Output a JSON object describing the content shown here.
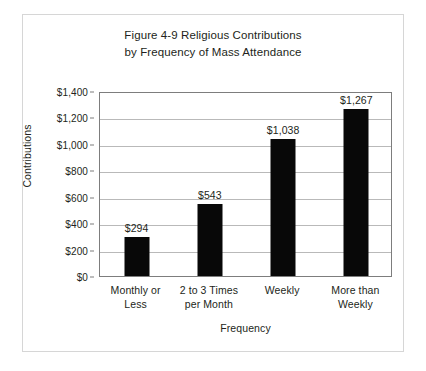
{
  "chart_data": {
    "type": "bar",
    "title": "Figure 4-9 Religious Contributions by Frequency of Mass Attendance",
    "title_lines": [
      "Figure 4-9 Religious Contributions",
      "by Frequency of Mass Attendance"
    ],
    "xlabel": "Frequency",
    "ylabel": "Contributions",
    "categories": [
      "Monthly or Less",
      "2 to 3 Times per Month",
      "Weekly",
      "More than Weekly"
    ],
    "category_lines": [
      [
        "Monthly or",
        "Less"
      ],
      [
        "2 to 3 Times",
        "per Month"
      ],
      [
        "Weekly",
        ""
      ],
      [
        "More than",
        "Weekly"
      ]
    ],
    "values": [
      294,
      543,
      1038,
      1267
    ],
    "value_labels": [
      "$294",
      "$543",
      "$1,038",
      "$1,267"
    ],
    "ylim": [
      0,
      1400
    ],
    "ytick_values": [
      0,
      200,
      400,
      600,
      800,
      1000,
      1200,
      1400
    ],
    "ytick_labels": [
      "$0",
      "$200",
      "$400",
      "$600",
      "$800",
      "$1,000",
      "$1,200",
      "$1,400"
    ],
    "grid": true,
    "legend": null,
    "bar_color": "#080808",
    "gridline_color": "#b9b9b9",
    "axis_color": "#7d7d7d",
    "text_color": "#231f20",
    "background_color": "#ffffff"
  }
}
